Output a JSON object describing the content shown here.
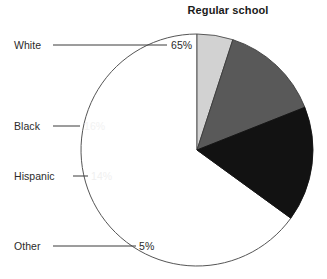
{
  "chart_data": {
    "type": "pie",
    "title": "Regular school",
    "xlabel": "",
    "ylabel": "",
    "legend_position": "none",
    "grid": false,
    "categories": [
      "White",
      "Black",
      "Hispanic",
      "Other"
    ],
    "values": [
      65,
      16,
      14,
      5
    ],
    "value_labels": [
      "65%",
      "16%",
      "14%",
      "5%"
    ],
    "unit": "%",
    "slice_colors": [
      "#ffffff",
      "#121212",
      "#595959",
      "#d2d2d2"
    ],
    "outline_color": "#555555",
    "start_angle_deg": 90,
    "direction": "counterclockwise",
    "annotations": [
      {
        "category": "White",
        "label": "White",
        "value_label": "65%"
      },
      {
        "category": "Black",
        "label": "Black",
        "value_label": "16%"
      },
      {
        "category": "Hispanic",
        "label": "Hispanic",
        "value_label": "14%"
      },
      {
        "category": "Other",
        "label": "Other",
        "value_label": "5%"
      }
    ]
  },
  "title": {
    "text": "Regular school"
  },
  "labels": {
    "white": "White",
    "black": "Black",
    "hispanic": "Hispanic",
    "other": "Other"
  },
  "values": {
    "white": "65%",
    "black": "16%",
    "hispanic": "14%",
    "other": "5%"
  }
}
